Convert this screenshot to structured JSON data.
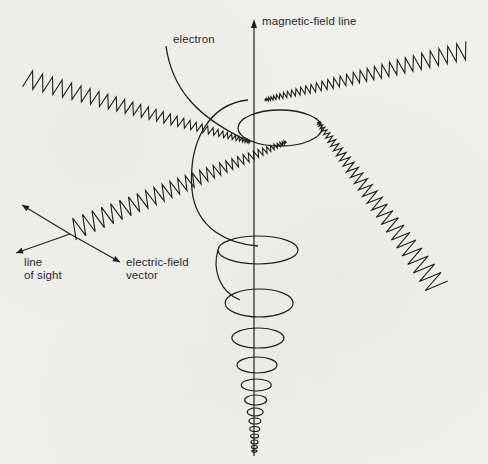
{
  "figure": {
    "labels": {
      "magnetic_field_line": "magnetic-field line",
      "electron": "electron",
      "line_of_sight_1": "line",
      "line_of_sight_2": "of sight",
      "electric_field_1": "electric-field",
      "electric_field_2": "vector"
    },
    "colors": {
      "background": "#efefec",
      "ink": "#1e1e1e"
    }
  }
}
